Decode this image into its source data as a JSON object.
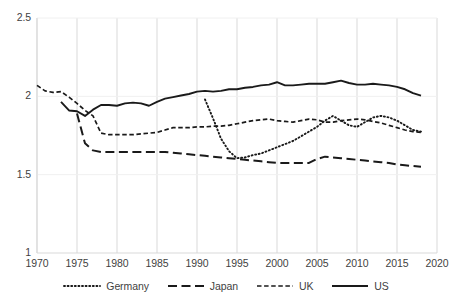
{
  "chart_data": {
    "type": "line",
    "title": "",
    "xlabel": "",
    "ylabel": "",
    "xlim": [
      1970,
      2020
    ],
    "ylim": [
      1,
      2.5
    ],
    "grid": true,
    "grid_axis": "x",
    "legend_position": "bottom",
    "xticks": [
      "1970",
      "1975",
      "1980",
      "1985",
      "1990",
      "1995",
      "2000",
      "2005",
      "2010",
      "2015",
      "2020"
    ],
    "yticks": [
      "1",
      "1.5",
      "2",
      "2.5"
    ],
    "series": [
      {
        "name": "Germany",
        "style": "dotted",
        "color": "#1a1a1a",
        "x": [
          1991,
          1992,
          1993,
          1994,
          1995,
          1996,
          1997,
          1998,
          1999,
          2000,
          2001,
          2002,
          2003,
          2004,
          2005,
          2006,
          2007,
          2008,
          2009,
          2010,
          2011,
          2012,
          2013,
          2014,
          2015,
          2016,
          2017,
          2018
        ],
        "values": [
          1.98,
          1.86,
          1.73,
          1.65,
          1.605,
          1.61,
          1.625,
          1.635,
          1.655,
          1.675,
          1.695,
          1.715,
          1.745,
          1.775,
          1.805,
          1.845,
          1.875,
          1.845,
          1.815,
          1.805,
          1.835,
          1.865,
          1.875,
          1.865,
          1.845,
          1.815,
          1.785,
          1.775
        ]
      },
      {
        "name": "Japan",
        "style": "dashed-long",
        "color": "#1a1a1a",
        "x": [
          1975,
          1976,
          1977,
          1978,
          1979,
          1980,
          1981,
          1982,
          1983,
          1984,
          1985,
          1986,
          1987,
          1988,
          1989,
          1990,
          1991,
          1992,
          1993,
          1994,
          1995,
          1996,
          1997,
          1998,
          1999,
          2000,
          2001,
          2002,
          2003,
          2004,
          2005,
          2006,
          2007,
          2008,
          2009,
          2010,
          2011,
          2012,
          2013,
          2014,
          2015,
          2016,
          2017,
          2018
        ],
        "values": [
          1.89,
          1.7,
          1.655,
          1.645,
          1.645,
          1.645,
          1.645,
          1.645,
          1.645,
          1.645,
          1.645,
          1.645,
          1.64,
          1.635,
          1.63,
          1.625,
          1.62,
          1.615,
          1.61,
          1.605,
          1.6,
          1.595,
          1.59,
          1.585,
          1.58,
          1.575,
          1.575,
          1.575,
          1.575,
          1.575,
          1.6,
          1.615,
          1.61,
          1.605,
          1.6,
          1.595,
          1.59,
          1.585,
          1.58,
          1.575,
          1.565,
          1.56,
          1.555,
          1.55
        ]
      },
      {
        "name": "UK",
        "style": "dashed-short",
        "color": "#1a1a1a",
        "x": [
          1970,
          1971,
          1972,
          1973,
          1974,
          1975,
          1976,
          1977,
          1978,
          1979,
          1980,
          1981,
          1982,
          1983,
          1984,
          1985,
          1986,
          1987,
          1988,
          1989,
          1990,
          1991,
          1992,
          1993,
          1994,
          1995,
          1996,
          1997,
          1998,
          1999,
          2000,
          2001,
          2002,
          2003,
          2004,
          2005,
          2006,
          2007,
          2008,
          2009,
          2010,
          2011,
          2012,
          2013,
          2014,
          2015,
          2016,
          2017,
          2018
        ],
        "values": [
          2.07,
          2.035,
          2.025,
          2.03,
          1.995,
          1.955,
          1.91,
          1.875,
          1.765,
          1.755,
          1.755,
          1.755,
          1.755,
          1.76,
          1.765,
          1.77,
          1.785,
          1.8,
          1.8,
          1.8,
          1.805,
          1.805,
          1.81,
          1.81,
          1.815,
          1.825,
          1.835,
          1.845,
          1.85,
          1.855,
          1.845,
          1.84,
          1.835,
          1.845,
          1.855,
          1.85,
          1.835,
          1.835,
          1.845,
          1.85,
          1.855,
          1.85,
          1.84,
          1.83,
          1.815,
          1.8,
          1.785,
          1.775,
          1.77
        ]
      },
      {
        "name": "US",
        "style": "solid",
        "color": "#1a1a1a",
        "x": [
          1973,
          1974,
          1975,
          1976,
          1977,
          1978,
          1979,
          1980,
          1981,
          1982,
          1983,
          1984,
          1985,
          1986,
          1987,
          1988,
          1989,
          1990,
          1991,
          1992,
          1993,
          1994,
          1995,
          1996,
          1997,
          1998,
          1999,
          2000,
          2001,
          2002,
          2003,
          2004,
          2005,
          2006,
          2007,
          2008,
          2009,
          2010,
          2011,
          2012,
          2013,
          2014,
          2015,
          2016,
          2017,
          2018
        ],
        "values": [
          1.965,
          1.91,
          1.905,
          1.875,
          1.915,
          1.945,
          1.945,
          1.94,
          1.955,
          1.96,
          1.955,
          1.94,
          1.965,
          1.985,
          1.995,
          2.005,
          2.015,
          2.03,
          2.035,
          2.03,
          2.035,
          2.045,
          2.045,
          2.055,
          2.06,
          2.07,
          2.075,
          2.09,
          2.07,
          2.07,
          2.075,
          2.08,
          2.08,
          2.08,
          2.09,
          2.1,
          2.085,
          2.075,
          2.075,
          2.08,
          2.075,
          2.07,
          2.06,
          2.045,
          2.02,
          2.005
        ]
      }
    ]
  },
  "legend": {
    "items": [
      {
        "label": "Germany",
        "style": "dotted"
      },
      {
        "label": "Japan",
        "style": "dashed-long"
      },
      {
        "label": "UK",
        "style": "dashed-short"
      },
      {
        "label": "US",
        "style": "solid"
      }
    ]
  }
}
